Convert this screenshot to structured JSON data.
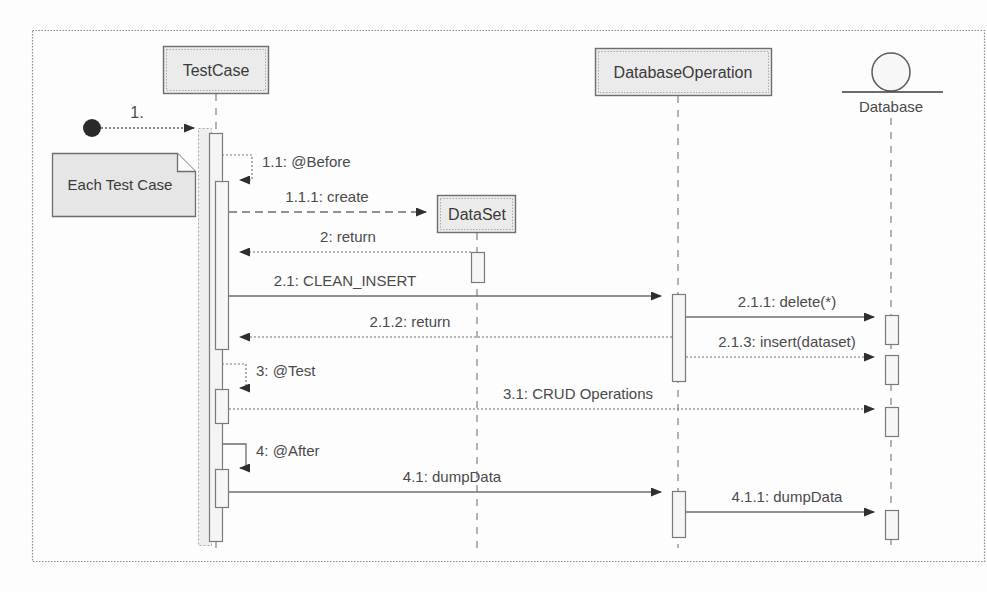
{
  "diagram": {
    "type": "uml-sequence-diagram",
    "title": "",
    "frame": {
      "x": 32,
      "y": 30,
      "width": 953,
      "height": 532
    },
    "colors": {
      "stroke": "#6e6e6e",
      "stroke_dark": "#4a4a4a",
      "box_fill": "#ebebeb",
      "activation_fill": "#f2f2f2",
      "note_fill": "#e6e6e6",
      "text": "#3a3a3a",
      "background": "#fdfdfd"
    }
  },
  "participants": [
    {
      "id": "testcase",
      "label": "TestCase",
      "kind": "class-box",
      "box": {
        "x": 163,
        "y": 46,
        "width": 105,
        "height": 48
      },
      "lifeline_x": 216
    },
    {
      "id": "dataset",
      "label": "DataSet",
      "kind": "class-box",
      "box": {
        "x": 437,
        "y": 195,
        "width": 78,
        "height": 38
      },
      "lifeline_x": 477
    },
    {
      "id": "databaseoperation",
      "label": "DatabaseOperation",
      "kind": "class-box",
      "box": {
        "x": 595,
        "y": 48,
        "width": 176,
        "height": 48
      },
      "lifeline_x": 678
    },
    {
      "id": "database",
      "label": "Database",
      "kind": "actor-circle",
      "circle": {
        "cx": 891,
        "cy": 72,
        "r": 19
      },
      "baseline": {
        "x1": 842,
        "x2": 943,
        "y": 92
      },
      "lifeline_x": 891
    }
  ],
  "note": {
    "label": "Each Test Case",
    "box": {
      "x": 52,
      "y": 153,
      "width": 143,
      "height": 63
    },
    "fold": 18
  },
  "start_point": {
    "label": "1.",
    "dot": {
      "cx": 92,
      "cy": 128,
      "r": 9
    },
    "target_x": 205,
    "y": 128
  },
  "messages": [
    {
      "seq": "1.",
      "label": "1.",
      "from": "start",
      "to": "testcase",
      "style": "dotted",
      "arrow": "filled",
      "y": 128
    },
    {
      "seq": "1.1",
      "label": "1.1: @Before",
      "from": "testcase",
      "to": "testcase",
      "style": "dotted",
      "arrow": "filled",
      "kind": "self-call",
      "y_top": 155,
      "y_bottom": 180,
      "loop_x": 252
    },
    {
      "seq": "1.1.1",
      "label": "1.1.1: create",
      "from": "testcase",
      "to": "dataset",
      "style": "dashed",
      "arrow": "filled",
      "y": 212
    },
    {
      "seq": "2",
      "label": "2: return",
      "from": "dataset",
      "to": "testcase",
      "style": "dotted",
      "arrow": "filled",
      "y": 252
    },
    {
      "seq": "2.1",
      "label": "2.1: CLEAN_INSERT",
      "from": "testcase",
      "to": "databaseoperation",
      "style": "solid",
      "arrow": "filled",
      "y": 296
    },
    {
      "seq": "2.1.1",
      "label": "2.1.1: delete(*)",
      "from": "databaseoperation",
      "to": "database",
      "style": "solid",
      "arrow": "filled",
      "y": 317
    },
    {
      "seq": "2.1.2",
      "label": "2.1.2: return",
      "from": "databaseoperation",
      "to": "testcase",
      "style": "dotted",
      "arrow": "filled",
      "y": 337
    },
    {
      "seq": "2.1.3",
      "label": "2.1.3: insert(dataset)",
      "from": "databaseoperation",
      "to": "database",
      "style": "dotted",
      "arrow": "filled",
      "y": 357
    },
    {
      "seq": "3",
      "label": "3: @Test",
      "from": "testcase",
      "to": "testcase",
      "style": "dotted",
      "arrow": "filled",
      "kind": "self-call",
      "y_top": 364,
      "y_bottom": 388,
      "loop_x": 242
    },
    {
      "seq": "3.1",
      "label": "3.1: CRUD Operations",
      "from": "testcase",
      "to": "database",
      "style": "dotted",
      "arrow": "filled",
      "y": 409
    },
    {
      "seq": "4",
      "label": "4: @After",
      "from": "testcase",
      "to": "testcase",
      "style": "solid",
      "arrow": "filled",
      "kind": "self-call",
      "y_top": 444,
      "y_bottom": 468,
      "loop_x": 242
    },
    {
      "seq": "4.1",
      "label": "4.1: dumpData",
      "from": "testcase",
      "to": "databaseoperation",
      "style": "solid",
      "arrow": "filled",
      "y": 492
    },
    {
      "seq": "4.1.1",
      "label": "4.1.1: dumpData",
      "from": "databaseoperation",
      "to": "database",
      "style": "solid",
      "arrow": "filled",
      "y": 512
    }
  ],
  "activations": [
    {
      "participant": "testcase",
      "x": 205,
      "y": 128,
      "width": 13,
      "height": 416,
      "kind": "outer"
    },
    {
      "participant": "testcase",
      "x": 211,
      "y": 133,
      "width": 13,
      "height": 408,
      "kind": "outer-inner"
    },
    {
      "participant": "testcase",
      "x": 211,
      "y": 180,
      "width": 13,
      "height": 170,
      "kind": "nested"
    },
    {
      "participant": "testcase",
      "x": 211,
      "y": 388,
      "width": 13,
      "height": 36,
      "kind": "nested"
    },
    {
      "participant": "testcase",
      "x": 211,
      "y": 468,
      "width": 13,
      "height": 40,
      "kind": "nested"
    },
    {
      "participant": "dataset",
      "x": 471,
      "y": 252,
      "width": 13,
      "height": 30,
      "kind": "nested"
    },
    {
      "participant": "databaseoperation",
      "x": 672,
      "y": 293,
      "width": 13,
      "height": 88,
      "kind": "nested"
    },
    {
      "participant": "databaseoperation",
      "x": 672,
      "y": 490,
      "width": 13,
      "height": 48,
      "kind": "nested"
    },
    {
      "participant": "database",
      "x": 885,
      "y": 314,
      "width": 13,
      "height": 30,
      "kind": "nested"
    },
    {
      "participant": "database",
      "x": 885,
      "y": 354,
      "width": 13,
      "height": 30,
      "kind": "nested"
    },
    {
      "participant": "database",
      "x": 885,
      "y": 406,
      "width": 13,
      "height": 30,
      "kind": "nested"
    },
    {
      "participant": "database",
      "x": 885,
      "y": 509,
      "width": 13,
      "height": 30,
      "kind": "nested"
    }
  ]
}
